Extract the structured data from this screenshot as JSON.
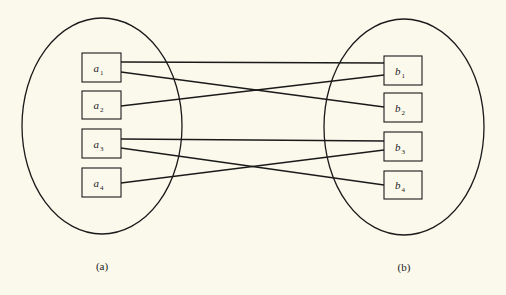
{
  "diagram": {
    "type": "mapping",
    "stroke_color": "#1a1a1a",
    "background": "#fbf9ec",
    "sets": [
      {
        "id": "a",
        "caption": "(a)",
        "ellipse": {
          "cx": 102,
          "cy": 126,
          "rx": 80,
          "ry": 108
        },
        "caption_pos": {
          "x": 102,
          "y": 270
        },
        "elements": [
          {
            "id": "a1",
            "base": "a",
            "sub": "1",
            "x": 82,
            "y": 53,
            "w": 39,
            "h": 29
          },
          {
            "id": "a2",
            "base": "a",
            "sub": "2",
            "x": 82,
            "y": 91,
            "w": 39,
            "h": 28
          },
          {
            "id": "a3",
            "base": "a",
            "sub": "3",
            "x": 82,
            "y": 129,
            "w": 39,
            "h": 29
          },
          {
            "id": "a4",
            "base": "a",
            "sub": "4",
            "x": 82,
            "y": 168,
            "w": 39,
            "h": 29
          }
        ]
      },
      {
        "id": "b",
        "caption": "(b)",
        "ellipse": {
          "cx": 404,
          "cy": 127,
          "rx": 80,
          "ry": 108
        },
        "caption_pos": {
          "x": 404,
          "y": 271
        },
        "elements": [
          {
            "id": "b1",
            "base": "b",
            "sub": "1",
            "x": 384,
            "y": 56,
            "w": 38,
            "h": 29
          },
          {
            "id": "b2",
            "base": "b",
            "sub": "2",
            "x": 384,
            "y": 93,
            "w": 38,
            "h": 29
          },
          {
            "id": "b3",
            "base": "b",
            "sub": "3",
            "x": 384,
            "y": 132,
            "w": 38,
            "h": 29
          },
          {
            "id": "b4",
            "base": "b",
            "sub": "4",
            "x": 384,
            "y": 171,
            "w": 38,
            "h": 28
          }
        ]
      }
    ],
    "edges": [
      {
        "from": "a1",
        "to": "b1",
        "x1": 121,
        "y1": 62,
        "x2": 384,
        "y2": 63
      },
      {
        "from": "a1",
        "to": "b2",
        "x1": 121,
        "y1": 72,
        "x2": 384,
        "y2": 107
      },
      {
        "from": "a2",
        "to": "b1",
        "x1": 121,
        "y1": 106,
        "x2": 384,
        "y2": 75
      },
      {
        "from": "a3",
        "to": "b3",
        "x1": 121,
        "y1": 139,
        "x2": 384,
        "y2": 141
      },
      {
        "from": "a3",
        "to": "b4",
        "x1": 121,
        "y1": 148,
        "x2": 384,
        "y2": 185
      },
      {
        "from": "a4",
        "to": "b3",
        "x1": 121,
        "y1": 183,
        "x2": 384,
        "y2": 150
      }
    ]
  },
  "labels": {
    "a1": {
      "base": "a",
      "sub": "1"
    },
    "a2": {
      "base": "a",
      "sub": "2"
    },
    "a3": {
      "base": "a",
      "sub": "3"
    },
    "a4": {
      "base": "a",
      "sub": "4"
    },
    "b1": {
      "base": "b",
      "sub": "1"
    },
    "b2": {
      "base": "b",
      "sub": "2"
    },
    "b3": {
      "base": "b",
      "sub": "3"
    },
    "b4": {
      "base": "b",
      "sub": "4"
    },
    "caption_a": "(a)",
    "caption_b": "(b)"
  }
}
